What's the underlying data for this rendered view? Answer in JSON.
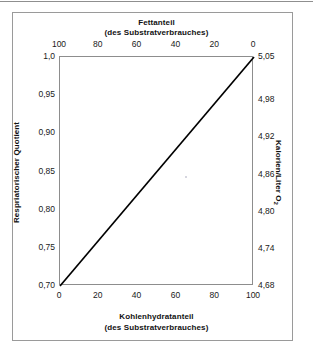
{
  "chart_data": {
    "type": "line",
    "title": "",
    "top_axis": {
      "label_line1": "Fettanteil",
      "label_line2": "(des Substratverbrauches)",
      "ticks": [
        "100",
        "80",
        "60",
        "40",
        "20",
        "0"
      ],
      "values": [
        100,
        80,
        60,
        40,
        20,
        0
      ],
      "range": [
        100,
        0
      ],
      "reversed": true
    },
    "bottom_axis": {
      "label_line1": "Kohlenhydratanteil",
      "label_line2": "(des Substratverbrauches)",
      "ticks": [
        "0",
        "20",
        "40",
        "60",
        "80",
        "100"
      ],
      "values": [
        0,
        20,
        40,
        60,
        80,
        100
      ],
      "range": [
        0,
        100
      ]
    },
    "left_axis": {
      "label": "Respriatorischer Quotient",
      "ticks": [
        "1,0",
        "0,95",
        "0,90",
        "0,85",
        "0,80",
        "0,75",
        "0,70"
      ],
      "values": [
        1.0,
        0.95,
        0.9,
        0.85,
        0.8,
        0.75,
        0.7
      ],
      "range": [
        0.7,
        1.0
      ]
    },
    "right_axis": {
      "label": "Kalorien/Liter O",
      "label_sub": "2",
      "ticks": [
        "5,05",
        "4,98",
        "4,92",
        "4,86",
        "4,80",
        "4,74",
        "4,68"
      ],
      "values": [
        5.05,
        4.98,
        4.92,
        4.86,
        4.8,
        4.74,
        4.68
      ],
      "range": [
        4.68,
        5.05
      ]
    },
    "series": [
      {
        "name": "Respiratorischer Quotient vs. Kohlenhydratanteil",
        "x": [
          0,
          100
        ],
        "y": [
          0.7,
          1.0
        ],
        "points": [
          {
            "kohlenhydratanteil": 0,
            "fettanteil": 100,
            "rq": 0.7,
            "kalorien_pro_liter_o2": 4.68
          },
          {
            "kohlenhydratanteil": 100,
            "fettanteil": 0,
            "rq": 1.0,
            "kalorien_pro_liter_o2": 5.05
          }
        ],
        "color": "#000000",
        "style": "solid"
      }
    ],
    "grid": false,
    "legend": null,
    "xlabel": "Kohlenhydratanteil (des Substratverbrauches)",
    "ylabel": "Respriatorischer Quotient",
    "xlim": [
      0,
      100
    ],
    "ylim": [
      0.7,
      1.0
    ]
  },
  "colors": {
    "line": "#000000",
    "frame": "#9a9a9a",
    "plot_border": "#8d8d8d",
    "text": "#111111",
    "background": "#ffffff"
  }
}
